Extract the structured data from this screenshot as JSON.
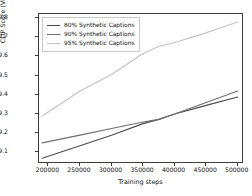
{
  "chart_data": {
    "type": "line",
    "title": "",
    "xlabel": "Training steps",
    "ylabel": "CLIP Score (ViT-B)",
    "xlim": [
      185000,
      510000
    ],
    "ylim": [
      29.04,
      29.82
    ],
    "xticks": [
      200000,
      250000,
      300000,
      350000,
      400000,
      450000,
      500000
    ],
    "xtick_labels": [
      "200000",
      "250000",
      "300000",
      "350000",
      "400000",
      "450000",
      "500000"
    ],
    "yticks": [
      29.1,
      29.2,
      29.3,
      29.4,
      29.5,
      29.6,
      29.7,
      29.8
    ],
    "ytick_labels": [
      "29.1",
      "29.2",
      "29.3",
      "29.4",
      "29.5",
      "29.6",
      "29.7",
      "29.8"
    ],
    "grid": false,
    "legend_position": "upper left",
    "x": [
      190000,
      250000,
      300000,
      350000,
      375000,
      400000,
      450000,
      500000
    ],
    "series": [
      {
        "name": "80% Synthetic Captions",
        "color": "#4a4a4a",
        "values": [
          29.07,
          29.135,
          29.19,
          29.25,
          29.272,
          29.3,
          29.345,
          29.388
        ]
      },
      {
        "name": "90% Synthetic Captions",
        "color": "#6e6e6e",
        "values": [
          29.15,
          29.19,
          29.225,
          29.258,
          29.272,
          29.3,
          29.36,
          29.42
        ]
      },
      {
        "name": "95% Synthetic Captions",
        "color": "#c2c2c2",
        "values": [
          29.29,
          29.42,
          29.505,
          29.615,
          29.652,
          29.672,
          29.722,
          29.778
        ]
      }
    ]
  },
  "legend": {
    "entries": [
      {
        "label": "80% Synthetic Captions"
      },
      {
        "label": "90% Synthetic Captions"
      },
      {
        "label": "95% Synthetic Captions"
      }
    ]
  }
}
